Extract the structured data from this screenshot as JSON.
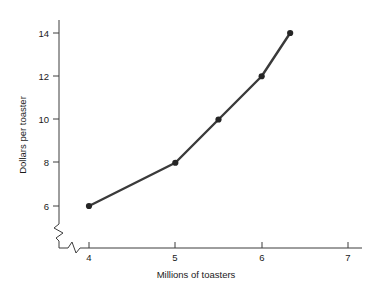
{
  "chart_data": {
    "type": "line",
    "title": "",
    "subtitle": "",
    "xlabel": "Millions of toasters",
    "ylabel": "Dollars per toaster",
    "x": [
      4,
      5,
      5.5,
      6,
      6.33
    ],
    "values": [
      6,
      8,
      10,
      12,
      14
    ],
    "series": [
      {
        "name": "",
        "x": [
          4,
          5,
          5.5,
          6,
          6.33
        ],
        "values": [
          6,
          8,
          10,
          12,
          14
        ]
      }
    ],
    "xlim": [
      3.6,
      7.2
    ],
    "ylim": [
      5.2,
      14.6
    ],
    "xticks": [
      4,
      5,
      6,
      7
    ],
    "xtick_labels": [
      "4",
      "5",
      "6",
      "7"
    ],
    "yticks": [
      6,
      8,
      10,
      12,
      14
    ],
    "ytick_labels": [
      "6",
      "8",
      "10",
      "12",
      "14"
    ],
    "grid": false,
    "legend": false,
    "legend_position": "none",
    "x_axis_break": true,
    "y_axis_break": true,
    "line_color": "#3a3a3a",
    "marker_color": "#252525",
    "axis_color": "#3d3d3d",
    "background_color": "#ffffff",
    "annotations": []
  },
  "axes": {
    "y_title": "Dollars per toaster",
    "x_title": "Millions of toasters",
    "y_tick_0": "6",
    "y_tick_1": "8",
    "y_tick_2": "10",
    "y_tick_3": "12",
    "y_tick_4": "14",
    "x_tick_0": "4",
    "x_tick_1": "5",
    "x_tick_2": "6",
    "x_tick_3": "7"
  }
}
